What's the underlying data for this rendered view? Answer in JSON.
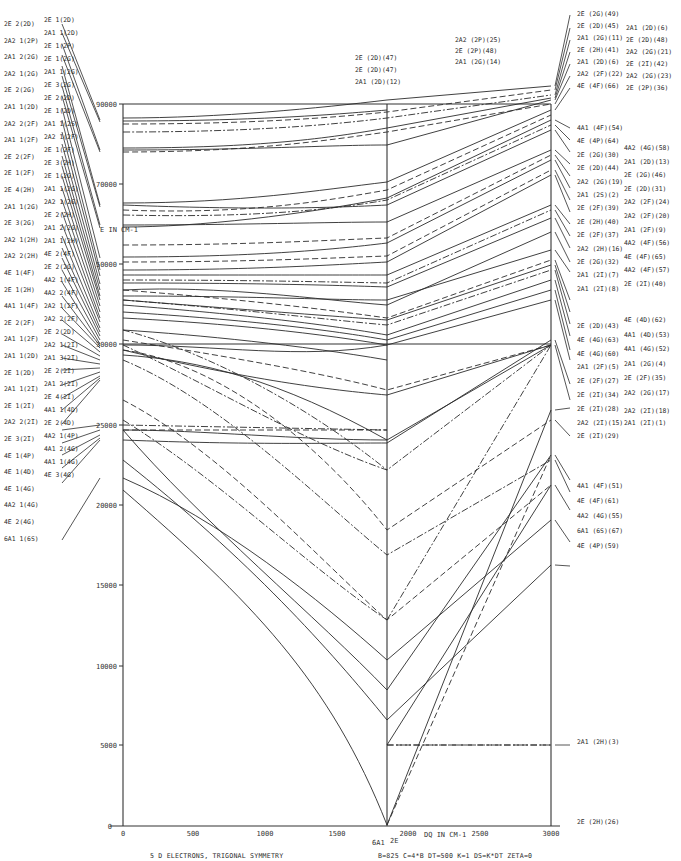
{
  "chart_data": {
    "type": "line",
    "title": "5 D ELECTRONS, TRIGONAL SYMMETRY",
    "parameters": "B=825  C=4*B  DT=500  K=1  DS=K*DT  ZETA=0",
    "xlabel": "DQ IN CM-1",
    "ylabel": "E IN CM-1",
    "xlim": [
      0,
      3000
    ],
    "x_ticks": [
      0,
      500,
      1000,
      1500,
      2000,
      2500,
      3000
    ],
    "y_ticks": [
      0,
      5000,
      10000,
      15000,
      20000,
      25000,
      30000,
      50000,
      70000,
      90000
    ],
    "y_tick_labels_printed": [
      "0",
      "5000",
      "10000",
      "15000",
      "20000",
      "25000",
      "30000",
      "50000",
      "30000",
      "90000"
    ],
    "y_scale_note": "linear 0-30000, compressed above 30000",
    "crossover": {
      "dq": 1850,
      "label_left": "6A1",
      "label_right": "2E"
    },
    "grid": false,
    "legend": "none",
    "left_terms_col1": [
      "2E 2(2D)",
      "2A2 1(2P)",
      "2A1 2(2G)",
      "2A2 1(2G)",
      "2E 2(2G)",
      "2A1 1(2D)",
      "2A2 2(2F)",
      "2A1 1(2F)",
      "2E 2(2F)",
      "2E 1(2F)",
      "2E 4(2H)",
      "2A1 1(2G)",
      "2E 3(2G)",
      "2A2 1(2H)",
      "2A2 2(2H)",
      "4E 1(4F)",
      "2E 1(2H)",
      "4A1 1(4F)",
      "2E 2(2F)",
      "2A1 1(2F)",
      "2A1 1(2D)",
      "2E 1(2D)",
      "2A1 1(2I)",
      "2E 1(2I)",
      "2A2 2(2I)",
      "2E 3(2I)",
      "4E 1(4P)",
      "4E 1(4D)",
      "4E 1(4G)",
      "4A2 1(4G)",
      "4E 2(4G)",
      "6A1 1(6S)"
    ],
    "left_terms_col2": [
      "2E 1(2D)",
      "2A1 1(2D)",
      "2E 1(2P)",
      "2E 1(2G)",
      "2A1 1(2G)",
      "2E 3(2G)",
      "2E 2(2D)",
      "2E 1(2D)",
      "2A1 1(2S)",
      "2A2 1(2F)",
      "2E 1(2F)",
      "2E 3(2H)",
      "2E 1(2G)",
      "2A1 1(2G)",
      "2A2 1(2G)",
      "2E 2(2H)",
      "2A1 2(2G)",
      "2A1 1(2H)",
      "4E 2(4F)",
      "2E 2(2G)",
      "4A2 1(4F)",
      "4A2 2(4F)",
      "2A2 1(2F)",
      "2A2 2(2F)",
      "2E 2(2D)",
      "2A2 1(2I)",
      "2A1 3(2I)",
      "2E 2(2I)",
      "2A1 2(2I)",
      "2E 4(2I)",
      "4A1 1(4D)",
      "2E 2(4D)",
      "4A2 1(4P)",
      "4A1 2(4G)",
      "4A1 1(4G)",
      "4E 3(4G)"
    ],
    "top_terms": [
      "2E (2D)(47)",
      "2E (2D)(47)",
      "2A1 (2D)(12)",
      "2A2 (2P)(25)",
      "2E (2P)(48)",
      "2A1 (2G)(14)"
    ],
    "right_terms_col1": [
      "2E (2G)(49)",
      "2E (2D)(45)",
      "2A1 (2G)(11)",
      "2E (2H)(41)",
      "2A1 (2D)(6)",
      "2A2 (2F)(22)",
      "4E (4F)(66)",
      "4A1 (4F)(54)",
      "4E (4P)(64)",
      "2E (2G)(30)",
      "2E (2D)(44)",
      "2A2 (2G)(19)",
      "2A1 (2S)(2)",
      "2E (2F)(39)",
      "2E (2H)(40)",
      "2E (2F)(37)",
      "2A2 (2H)(16)",
      "2E (2G)(32)",
      "2A1 (2I)(7)",
      "2A1 (2I)(8)",
      "2E (2D)(43)",
      "4E (4G)(63)",
      "4E (4G)(60)",
      "2A1 (2F)(5)",
      "2E (2F)(27)",
      "2E (2I)(34)",
      "2E (2I)(28)",
      "2A2 (2I)(15)",
      "2E (2I)(29)",
      "4A1 (4F)(51)",
      "4E (4F)(61)",
      "4A2 (4G)(55)",
      "6A1 (6S)(67)",
      "4E (4P)(59)",
      "2A1 (2H)(3)",
      "2E (2H)(26)"
    ],
    "right_terms_col2": [
      "2A1 (2D)(6)",
      "2E (2D)(48)",
      "2A2 (2G)(21)",
      "2E (2I)(42)",
      "2A2 (2G)(23)",
      "2E (2P)(36)",
      "4A2 (4G)(58)",
      "2A1 (2D)(13)",
      "2E (2G)(46)",
      "2E (2D)(31)",
      "2A2 (2F)(24)",
      "2A2 (2F)(20)",
      "2A1 (2F)(9)",
      "4A2 (4F)(56)",
      "4E (4F)(65)",
      "4A2 (4F)(57)",
      "2E (2I)(40)",
      "4E (4D)(62)",
      "4A1 (4D)(53)",
      "4A1 (4G)(52)",
      "2A1 (2G)(4)",
      "2E (2F)(35)",
      "2A2 (2G)(17)",
      "2A2 (2I)(18)",
      "2A1 (2I)(1)"
    ]
  },
  "caption": {
    "title": "5 D ELECTRONS, TRIGONAL SYMMETRY",
    "params": "B=825   C=4*B   DT=500   K=1   DS=K*DT   ZETA=0"
  },
  "axes": {
    "y_label": "E IN CM-1",
    "x_label": "DQ IN CM-1",
    "x_ticks": [
      "0",
      "500",
      "1000",
      "1500",
      "2000",
      "2500",
      "3000"
    ],
    "y_ticks": [
      "90000",
      "70000",
      "50000",
      "30000",
      "25000",
      "20000",
      "15000",
      "10000",
      "5000",
      "0"
    ],
    "crossover_left": "6A1",
    "crossover_right": "2E"
  },
  "levels": {
    "solid": [
      "123,118 C220,118 320,108 387,100 L551,86",
      "123,121 C250,121 330,115 387,110",
      "123,148 C260,148 330,138 387,128 L551,98",
      "123,150 C250,150 330,145 387,145 L551,100",
      "123,203 C240,203 320,190 387,182 L551,110",
      "123,205 C250,210 330,208 387,205 L551,130",
      "123,225 C240,225 330,222 387,222 L551,150",
      "123,227 C200,227 300,215 387,198 L551,120",
      "123,257 C250,257 330,250 387,243 L551,160",
      "123,270 C250,270 330,265 387,262 L551,175",
      "123,275 C250,275 330,275 387,275 L551,205",
      "123,283 C250,283 330,285 387,287 L551,218",
      "123,290 C220,285 320,300 387,305 L551,232",
      "123,296 C250,296 330,300 387,300 L551,250",
      "123,300 C250,310 330,316 387,320 L551,265",
      "123,305 C250,315 330,325 387,335 L551,280",
      "123,312 C250,320 330,330 387,340 L551,290",
      "123,318 C200,322 300,330 387,345 L551,300",
      "123,330 C200,335 300,345 387,360",
      "123,350 C250,380 330,390 387,395 L551,345",
      "123,355 C200,360 280,380 387,440 L551,345",
      "123,430 C200,430 300,440 387,440",
      "123,440 C250,445 330,443 387,443 L551,340",
      "123,478 C220,520 320,600 387,660",
      "123,490 C250,600 330,680 387,825",
      "123,460 C250,560 330,650 387,720 L551,565",
      "387,660 L551,520",
      "387,745 L551,485",
      "387,825 L551,410",
      "123,345 C220,345 300,360 387,345",
      "123,430 C200,520 320,620 387,690 L551,455"
    ],
    "dash": [
      "123,124 C250,124 330,118 387,112 L551,90",
      "123,152 C250,152 330,140 387,132 L551,104",
      "123,210 C250,215 330,200 387,190 L551,115",
      "123,245 C250,245 330,240 387,238 L551,155",
      "123,262 C250,262 330,258 387,256 L551,170",
      "123,290 C250,300 330,310 387,318 L551,260",
      "123,340 C250,360 330,375 387,390 L551,345",
      "123,350 C200,360 300,420 387,530 L551,420",
      "123,400 C220,450 320,560 387,620 L551,485",
      "123,430 L387,430",
      "387,745 L551,745",
      "387,825 L551,455"
    ],
    "dashdot": [
      "123,132 C250,132 330,125 387,118 L551,95",
      "123,215 C250,218 330,210 387,200 L551,125",
      "123,280 C250,280 330,282 387,283 L551,210",
      "123,300 C250,310 330,320 387,325 L551,270",
      "123,345 C200,380 300,440 387,470 L551,345",
      "123,425 L387,430",
      "123,360 C220,400 320,500 387,555 L551,460",
      "123,420 C220,480 300,560 387,620",
      "123,330 C200,350 300,400 387,470",
      "387,620 L551,345",
      "387,745 L551,745"
    ]
  },
  "leaders": {
    "left": [
      "62,24 L100,120",
      "62,33 L100,122",
      "62,44 L100,150",
      "62,55 L100,152",
      "62,66 L100,205",
      "62,76 L100,207",
      "62,86 L100,225",
      "62,96 L100,228",
      "62,108 L100,258",
      "62,120 L100,270",
      "62,132 L100,276",
      "62,144 L100,284",
      "62,156 L100,290",
      "62,166 L100,296",
      "62,176 L100,300",
      "62,188 L100,306",
      "62,200 L100,312",
      "62,212 L100,318",
      "62,224 L100,322",
      "62,236 L100,328",
      "62,248 L100,332",
      "62,258 L100,336",
      "62,270 L100,340",
      "62,282 L100,344",
      "62,296 L100,346",
      "62,308 L100,348",
      "62,320 L100,352",
      "62,334 L100,356",
      "62,345 L100,360",
      "62,358 L100,364",
      "62,370 L100,368",
      "62,385 L100,372",
      "62,398 L100,376",
      "62,410 L100,378",
      "62,424 L100,380",
      "62,430 L100,425",
      "62,443 L100,430",
      "62,455 L100,435",
      "62,468 L100,438",
      "62,483 L100,440",
      "62,540 L100,478"
    ],
    "right": [
      "555,86 L570,15",
      "555,90 L570,28",
      "555,95 L570,40",
      "555,98 L570,52",
      "555,100 L570,64",
      "555,104 L570,76",
      "555,110 L570,88",
      "555,120 L570,128",
      "555,125 L570,140",
      "555,130 L570,152",
      "555,150 L570,164",
      "555,155 L570,176",
      "555,160 L570,188",
      "555,170 L570,200",
      "555,175 L570,212",
      "555,205 L570,224",
      "555,210 L570,236",
      "555,218 L570,248",
      "555,232 L570,262",
      "555,250 L570,272",
      "555,260 L570,300",
      "555,265 L570,312",
      "555,270 L570,324",
      "555,280 L570,336",
      "555,290 L570,350",
      "555,300 L570,360",
      "555,340 L570,384",
      "555,345 L570,400",
      "555,410 L570,408",
      "555,420 L570,436",
      "555,455 L570,480",
      "555,460 L570,492",
      "555,485 L570,510",
      "555,520 L570,542",
      "555,565 L570,566",
      "555,745 L570,745"
    ]
  }
}
